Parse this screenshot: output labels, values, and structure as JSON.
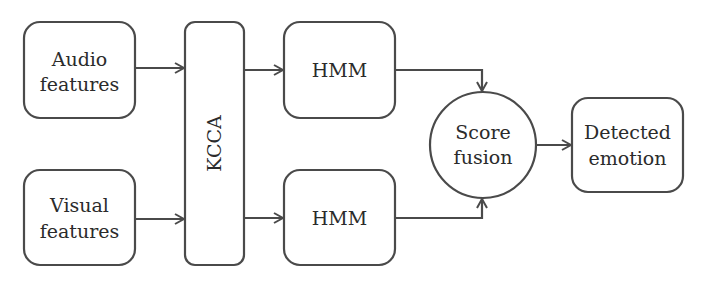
{
  "diagram": {
    "nodes": {
      "audio": {
        "lines": [
          "Audio",
          "features"
        ]
      },
      "visual": {
        "lines": [
          "Visual",
          "features"
        ]
      },
      "kcca": {
        "label": "KCCA"
      },
      "hmm_top": {
        "label": "HMM"
      },
      "hmm_bottom": {
        "label": "HMM"
      },
      "fusion": {
        "lines": [
          "Score",
          "fusion"
        ]
      },
      "output": {
        "lines": [
          "Detected",
          "emotion"
        ]
      }
    },
    "edges": [
      {
        "from": "audio",
        "to": "kcca"
      },
      {
        "from": "visual",
        "to": "kcca"
      },
      {
        "from": "kcca",
        "to": "hmm_top"
      },
      {
        "from": "kcca",
        "to": "hmm_bottom"
      },
      {
        "from": "hmm_top",
        "to": "fusion"
      },
      {
        "from": "hmm_bottom",
        "to": "fusion"
      },
      {
        "from": "fusion",
        "to": "output"
      }
    ]
  }
}
